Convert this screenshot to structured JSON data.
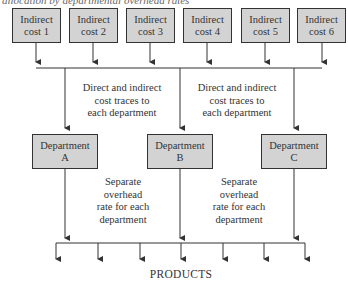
{
  "caption": "allocation by departmental overhead rates",
  "indirect_costs": [
    {
      "line1": "Indirect",
      "line2": "cost 1"
    },
    {
      "line1": "Indirect",
      "line2": "cost 2"
    },
    {
      "line1": "Indirect",
      "line2": "cost 3"
    },
    {
      "line1": "Indirect",
      "line2": "cost 4"
    },
    {
      "line1": "Indirect",
      "line2": "cost 5"
    },
    {
      "line1": "Indirect",
      "line2": "cost 6"
    }
  ],
  "departments": [
    {
      "line1": "Department",
      "line2": "A"
    },
    {
      "line1": "Department",
      "line2": "B"
    },
    {
      "line1": "Department",
      "line2": "C"
    }
  ],
  "trace_notes": [
    {
      "lines": [
        "Direct and indirect",
        "cost traces to",
        "each department"
      ]
    },
    {
      "lines": [
        "Direct and indirect",
        "cost traces to",
        "each department"
      ]
    }
  ],
  "rate_notes": [
    {
      "lines": [
        "Separate",
        "overhead",
        "rate for each",
        "department"
      ]
    },
    {
      "lines": [
        "Separate",
        "overhead",
        "rate for each",
        "department"
      ]
    }
  ],
  "products_label": "PRODUCTS",
  "colors": {
    "box_fill": "#d3d3d3",
    "line": "#333333"
  }
}
